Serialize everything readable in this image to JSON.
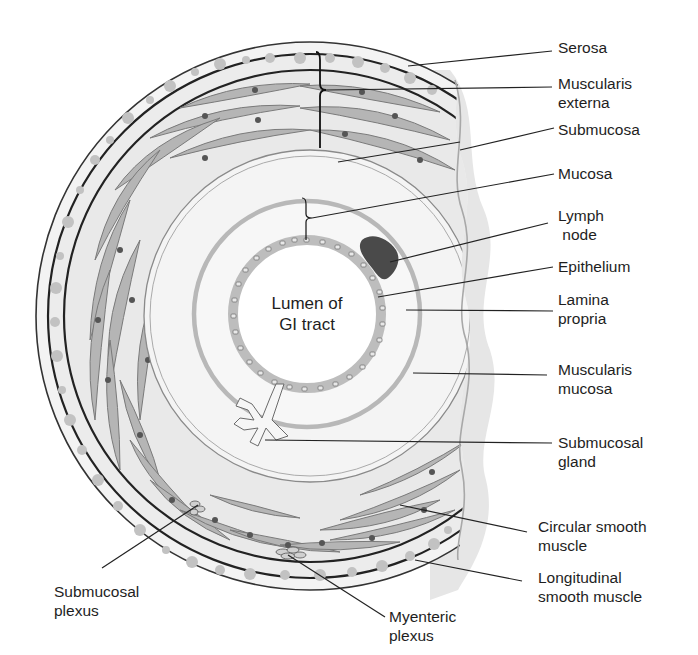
{
  "figure": {
    "center_label": "Lumen of\nGI tract",
    "colors": {
      "background": "#ffffff",
      "layer_fill": "#f2f2f2",
      "muscle_fill": "#b5b5b5",
      "muscle_stroke": "#7a7a7a",
      "nucleus": "#555555",
      "dark_line": "#222222",
      "mucosa_ring": "#b8b8b8",
      "epithelium": "#bdbdbd",
      "lymph_node": "#4a4a4a",
      "cut_shadow": "#e4e4e4",
      "dots": "#c4c4c4",
      "text": "#1e1e1e"
    }
  },
  "labels": {
    "right": [
      {
        "id": "serosa",
        "text": "Serosa"
      },
      {
        "id": "muscularis-externa",
        "text": "Muscularis\nexterna"
      },
      {
        "id": "submucosa",
        "text": "Submucosa"
      },
      {
        "id": "mucosa",
        "text": "Mucosa"
      },
      {
        "id": "lymph-node",
        "text": "Lymph\n node"
      },
      {
        "id": "epithelium",
        "text": "Epithelium"
      },
      {
        "id": "lamina-propria",
        "text": "Lamina\npropria"
      },
      {
        "id": "muscularis-mucosa",
        "text": "Muscularis\nmucosa"
      },
      {
        "id": "submucosal-gland",
        "text": "Submucosal\ngland"
      },
      {
        "id": "circular-smooth-muscle",
        "text": "Circular smooth\nmuscle"
      },
      {
        "id": "longitudinal-smooth-muscle",
        "text": "Longitudinal\nsmooth muscle"
      }
    ],
    "bottom": [
      {
        "id": "submucosal-plexus",
        "text": "Submucosal\nplexus"
      },
      {
        "id": "myenteric-plexus",
        "text": "Myenteric\nplexus"
      }
    ]
  }
}
